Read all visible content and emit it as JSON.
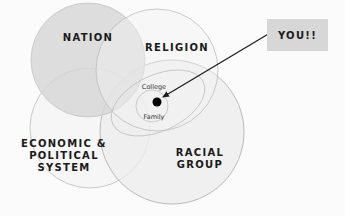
{
  "diagram": {
    "circles": [
      {
        "id": "nation",
        "label": "NATION",
        "fill": "#d9d9d9"
      },
      {
        "id": "religion",
        "label": "RELIGION",
        "fill": "#f0f0f0"
      },
      {
        "id": "economic",
        "label": "ECONOMIC &\nPOLITICAL\nSYSTEM",
        "fill": "#ececec"
      },
      {
        "id": "racial",
        "label": "RACIAL\nGROUP",
        "fill": "#ececec"
      }
    ],
    "inner": {
      "college_label": "College",
      "family_label": "Family"
    },
    "callout": {
      "label": "YOU!!",
      "box_color": "#d7d7d7"
    },
    "colors": {
      "background": "#fbfbfb",
      "stroke": "#b5b5b5",
      "arrow": "#1a1a1a",
      "dot": "#000000"
    }
  }
}
